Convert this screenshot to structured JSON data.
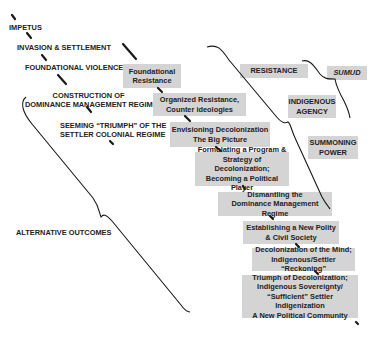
{
  "stages": [
    {
      "id": "impetus",
      "lines": [
        "IMPETUS"
      ]
    },
    {
      "id": "invasion",
      "lines": [
        "INVASION & SETTLEMENT"
      ]
    },
    {
      "id": "violence",
      "lines": [
        "FOUNDATIONAL VIOLENCE"
      ]
    },
    {
      "id": "construction",
      "lines": [
        "CONSTRUCTION OF",
        "DOMINANCE MANAGEMENT REGIME"
      ]
    },
    {
      "id": "triumph",
      "lines": [
        "SEEMING  “TRIUMPH” OF THE",
        "SETTLER COLONIAL REGIME"
      ]
    },
    {
      "id": "outcomes",
      "lines": [
        "ALTERNATIVE OUTCOMES"
      ]
    }
  ],
  "steps": [
    {
      "lines": [
        "Foundational",
        "Resistance"
      ]
    },
    {
      "lines": [
        "Organized Resistance,",
        "Counter ideologies"
      ]
    },
    {
      "lines": [
        "Envisioning Decolonization",
        "The Big Picture"
      ]
    },
    {
      "lines": [
        "Formulating a Program &",
        "Strategy of Decolonization;",
        "Becoming a Political Player"
      ]
    },
    {
      "lines": [
        "Dismantling the",
        "Dominance Management Regime"
      ]
    },
    {
      "lines": [
        "Establishing a New Polity",
        "& Civil Society"
      ]
    },
    {
      "lines": [
        "Decolonization of the Mind;",
        "Indigenous/Settler “Reckoning”"
      ]
    },
    {
      "lines": [
        "Triumph of Decolonization;",
        "Indigenous Sovereignty/",
        "“Sufficient” Settler Indigenization",
        "A New Political Community"
      ]
    }
  ],
  "side_labels": {
    "resistance": {
      "lines": [
        "RESISTANCE"
      ]
    },
    "sumud": {
      "lines": [
        "SUMUD"
      ]
    },
    "agency": {
      "lines": [
        "INDIGENOUS",
        "AGENCY"
      ]
    },
    "power": {
      "lines": [
        "SUMMONING",
        "POWER"
      ]
    }
  },
  "colors": {
    "box_fill": "#d4d4d4",
    "line": "#1a1a1a",
    "background": "#ffffff"
  }
}
